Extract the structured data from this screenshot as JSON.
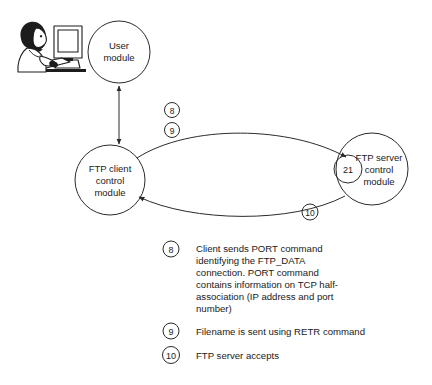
{
  "diagram": {
    "type": "network-flow-diagram",
    "background_color": "#ffffff",
    "line_color": "#2b2b2b",
    "text_color": "#1a1a1a",
    "nodes": [
      {
        "id": "user-module",
        "label_line1": "User",
        "label_line2": "module",
        "shape": "circle"
      },
      {
        "id": "ftp-client-control-module",
        "label_line1": "FTP client",
        "label_line2": "control",
        "label_line3": "module",
        "shape": "circle"
      },
      {
        "id": "ftp-server-control-module",
        "label_line1": "FTP server",
        "label_line2": "control",
        "label_line3": "module",
        "shape": "circle",
        "port": "21"
      }
    ],
    "edge_markers": [
      {
        "id": "marker-8",
        "number": "8"
      },
      {
        "id": "marker-9",
        "number": "9"
      },
      {
        "id": "marker-10",
        "number": "10"
      }
    ],
    "illustration": {
      "id": "user-at-computer",
      "description": "person seated at a desktop computer"
    }
  },
  "legend": {
    "items": [
      {
        "number": "8",
        "lines": [
          "Client sends PORT command",
          "identifying the FTP_DATA",
          "connection. PORT command",
          "contains information on TCP half-",
          "association (IP address and port",
          "number)"
        ]
      },
      {
        "number": "9",
        "lines": [
          "Filename is sent using RETR command"
        ]
      },
      {
        "number": "10",
        "lines": [
          "FTP server accepts"
        ]
      }
    ]
  }
}
